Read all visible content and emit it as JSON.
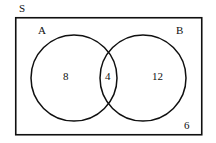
{
  "diagram": {
    "type": "venn-2-set",
    "title_label": "S",
    "universe": {
      "name": "S",
      "label": "S",
      "outside_count": "6"
    },
    "sets": [
      {
        "key": "A",
        "label": "A",
        "only_count": "8"
      },
      {
        "key": "B",
        "label": "B",
        "only_count": "12"
      }
    ],
    "intersection": {
      "label": "A and B",
      "count": "4"
    },
    "colors": {
      "stroke": "#101010",
      "background": "#ffffff",
      "text": "#101010"
    },
    "geometry": {
      "rect": {
        "x": 15,
        "y": 17,
        "width": 187,
        "height": 118
      },
      "circle_a": {
        "cx": 74,
        "cy": 78,
        "r": 43
      },
      "circle_b": {
        "cx": 143,
        "cy": 78,
        "r": 43
      }
    }
  }
}
